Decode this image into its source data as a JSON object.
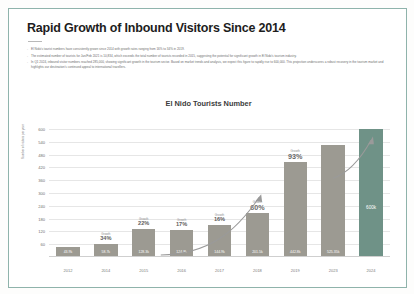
{
  "document": {
    "title": "Rapid Growth of Inbound Visitors Since 2014",
    "bullets": [
      "El Nido's tourist numbers have consistently grown since 2014 with growth rates ranging from 16% to 34% in 2019.",
      "The estimated number of tourists for Jan/Feb 2021 is 10,834, which exceeds the total number of tourists recorded in 2015, suggesting the potential for significant growth in El Nido's tourism industry.",
      "In Q1 2024, inbound visitor numbers reached 285,000, showing significant growth in the tourism sector. Based on market trends and analysis, we expect this figure to rapidly rise to 600,000. This projection underscores a robust recovery in the tourism market and highlights our destination's continued appeal to international travellers."
    ]
  },
  "chart_data": {
    "type": "bar",
    "title": "El Nido Tourists Number",
    "xlabel": "",
    "ylabel": "Number of visitors per year",
    "ylim": [
      0,
      600
    ],
    "yticks": [
      60,
      120,
      180,
      240,
      300,
      360,
      420,
      480,
      540,
      600
    ],
    "grid": true,
    "legend": "none",
    "categories": [
      "2012",
      "2014",
      "2015",
      "2016",
      "2017",
      "2018",
      "2019",
      "2023",
      "2024"
    ],
    "values": [
      43.96,
      58.76,
      128.35,
      124.86,
      144.96,
      201.36,
      442.85,
      525.35,
      600
    ],
    "data_labels": [
      "43.9k",
      "58.7k",
      "128.3k",
      "124.8k",
      "144.9k",
      "201.5k",
      "442.8k",
      "525.35k",
      "600k"
    ],
    "colors": {
      "bar": "#9c9a92",
      "accent_bar": "#6f9287",
      "accent_index": 8,
      "grid": "#e6e6e6",
      "frame": "#8fb3ab"
    },
    "annotations": [
      {
        "category": "2014",
        "caption": "Growth",
        "value": "34%"
      },
      {
        "category": "2015",
        "caption": "Growth",
        "value": "22%"
      },
      {
        "category": "2016",
        "caption": "Growth",
        "value": "17%"
      },
      {
        "category": "2017",
        "caption": "Growth",
        "value": "16%"
      },
      {
        "category": "2018",
        "caption": "Growth",
        "value": "60%"
      },
      {
        "category": "2019",
        "caption": "Growth",
        "value": "93%"
      }
    ],
    "trend_arrows": [
      "rising curve from 2017 to 2019",
      "rising curve from 2023 to 2024"
    ]
  }
}
